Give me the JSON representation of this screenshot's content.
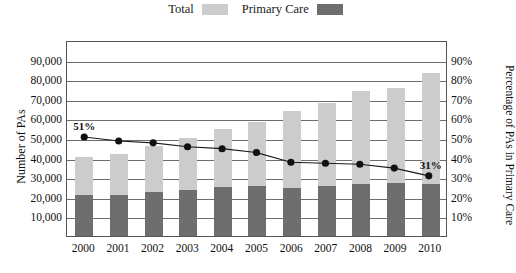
{
  "legend": {
    "entries": [
      {
        "label": "Total",
        "color": "#cccccc",
        "name": "legend-total"
      },
      {
        "label": "Primary Care",
        "color": "#6e6e6e",
        "name": "legend-primary-care"
      }
    ]
  },
  "axes": {
    "left_title": "Number of PAs",
    "right_title": "Percentage of PAs in Primary Care",
    "left_ticks": [
      "10,000",
      "20,000",
      "30,000",
      "40,000",
      "50,000",
      "60,000",
      "70,000",
      "80,000",
      "90,000"
    ],
    "right_ticks": [
      "10%",
      "20%",
      "30%",
      "40%",
      "50%",
      "60%",
      "70%",
      "80%",
      "90%"
    ]
  },
  "colors": {
    "total_bar": "#cccccc",
    "primary_bar": "#6e6e6e",
    "line": "#1a1a1a",
    "marker": "#111111",
    "grid": "#6d6d6d",
    "frame": "#555555"
  },
  "annotations": [
    {
      "text": "51%",
      "year": "2000"
    },
    {
      "text": "31%",
      "year": "2010"
    }
  ],
  "chart_data": {
    "type": "bar",
    "title": "",
    "subtitle": "",
    "xlabel": "",
    "ylabel": "Number of PAs",
    "y2label": "Percentage of PAs in Primary Care",
    "ylim": [
      0,
      100000
    ],
    "y2lim": [
      0,
      100
    ],
    "grid": true,
    "legend_position": "top-center",
    "categories": [
      "2000",
      "2001",
      "2002",
      "2003",
      "2004",
      "2005",
      "2006",
      "2007",
      "2008",
      "2009",
      "2010"
    ],
    "series": [
      {
        "name": "Total",
        "type": "bar",
        "axis": "left",
        "color": "#cccccc",
        "values": [
          40500,
          42000,
          46000,
          50000,
          54500,
          58000,
          64000,
          68000,
          74000,
          75500,
          83000
        ]
      },
      {
        "name": "Primary Care",
        "type": "bar",
        "axis": "left",
        "color": "#6e6e6e",
        "values": [
          21000,
          21000,
          22500,
          23500,
          25000,
          25500,
          24500,
          25500,
          26500,
          27000,
          26500
        ]
      },
      {
        "name": "Percentage of PAs in Primary Care",
        "type": "line",
        "axis": "right",
        "color": "#1a1a1a",
        "values": [
          51,
          49,
          48,
          46,
          45,
          43,
          38,
          37.5,
          37,
          35,
          31
        ],
        "labeled_points": {
          "2000": "51%",
          "2010": "31%"
        }
      }
    ]
  }
}
